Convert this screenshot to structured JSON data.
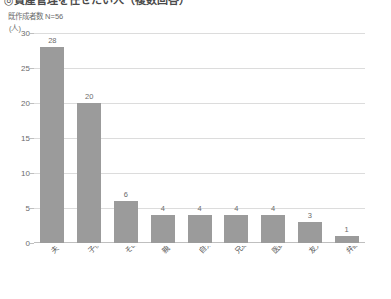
{
  "header": {
    "title_clipped": "◎資産管理を任せたい人（複数回答）",
    "sample_note": "既作成者数 N=56",
    "unit_label": "(人)"
  },
  "chart_data": {
    "type": "bar",
    "title": "◎資産管理を任せたい人（複数回答）",
    "subtitle": "既作成者数 N=56",
    "xlabel": "",
    "ylabel": "(人)",
    "ylim": [
      0,
      30
    ],
    "yticks": [
      0,
      5,
      10,
      15,
      20,
      25,
      30
    ],
    "ytick_labels": [
      "0",
      "5",
      "10",
      "15",
      "20",
      "25",
      "30"
    ],
    "grid": true,
    "legend": "none",
    "bar_color": "#9b9b9b",
    "categories": [
      "夫・妻",
      "子供",
      "その他",
      "親",
      "自分",
      "兄弟・姉妹",
      "医師",
      "友人",
      "弁護士等の専門家"
    ],
    "values": [
      28,
      20,
      6,
      4,
      4,
      4,
      4,
      3,
      1
    ],
    "value_labels": [
      "28",
      "20",
      "6",
      "4",
      "4",
      "4",
      "4",
      "3",
      "1"
    ]
  }
}
